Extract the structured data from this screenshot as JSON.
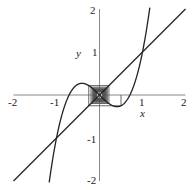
{
  "chart_data": {
    "type": "line",
    "title": "",
    "xlabel": "x",
    "ylabel": "y",
    "xlim": [
      -2,
      2
    ],
    "ylim": [
      -2,
      2
    ],
    "grid": false,
    "x_ticks": [
      "-2",
      "-1",
      "1",
      "2"
    ],
    "y_ticks": [
      "2",
      "1",
      "-1",
      "-2"
    ],
    "series": [
      {
        "name": "f(x) = 2x^3 - x",
        "kind": "curve",
        "x_range": [
          -1.17,
          1.17
        ]
      },
      {
        "name": "y = x",
        "kind": "line",
        "x_range": [
          -2,
          2
        ]
      },
      {
        "name": "cobweb iteration",
        "kind": "cobweb",
        "x0": 0.5,
        "iterations": 40
      }
    ],
    "annotations": [
      "cobweb diagram spiraling around fixed point (0,0)"
    ]
  },
  "colors": {
    "line": "#222222",
    "cobweb": "#555555"
  }
}
